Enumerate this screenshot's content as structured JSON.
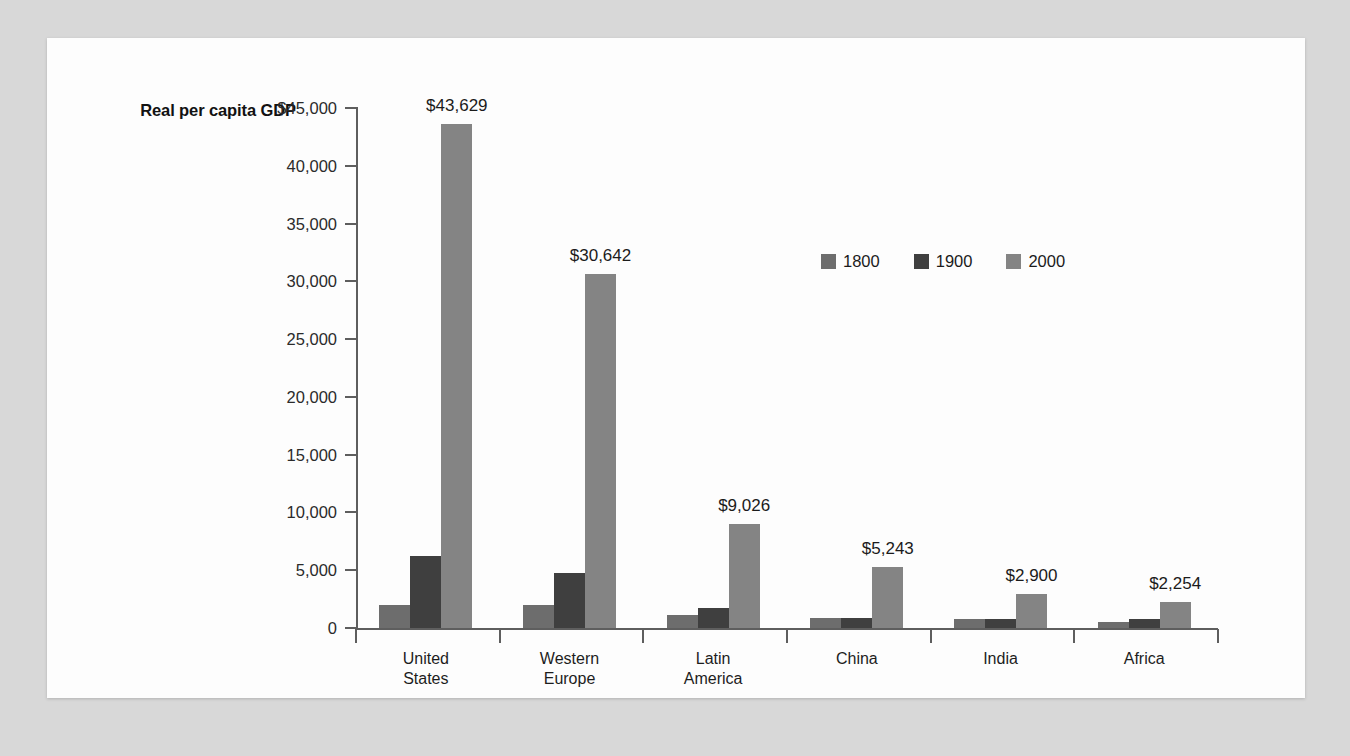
{
  "chart_data": {
    "type": "bar",
    "title": "",
    "subtitle": "",
    "ylabel": "Real per\ncapita GDP",
    "xlabel": "",
    "categories": [
      "United\nStates",
      "Western\nEurope",
      "Latin\nAmerica",
      "China",
      "India",
      "Africa"
    ],
    "series": [
      {
        "name": "1800",
        "color": "#6d6d6d",
        "values": [
          1980,
          1960,
          1150,
          860,
          820,
          560
        ]
      },
      {
        "name": "1900",
        "color": "#3f3f3f",
        "values": [
          6200,
          4750,
          1730,
          860,
          820,
          780
        ]
      },
      {
        "name": "2000",
        "color": "#848484",
        "values": [
          43629,
          30642,
          9026,
          5243,
          2900,
          2254
        ]
      }
    ],
    "value_labels": [
      "$43,629",
      "$30,642",
      "$9,026",
      "$5,243",
      "$2,900",
      "$2,254"
    ],
    "ylim": [
      0,
      45000
    ],
    "yticks": [
      0,
      5000,
      10000,
      15000,
      20000,
      25000,
      30000,
      35000,
      40000,
      45000
    ],
    "ytick_labels": [
      "0",
      "5,000",
      "10,000",
      "15,000",
      "20,000",
      "25,000",
      "30,000",
      "35,000",
      "40,000",
      "$45,000"
    ],
    "grid": false,
    "legend_position": "upper-center-right"
  },
  "legend": {
    "items": [
      {
        "label": "1800",
        "color": "#6d6d6d"
      },
      {
        "label": "1900",
        "color": "#3f3f3f"
      },
      {
        "label": "2000",
        "color": "#848484"
      }
    ]
  },
  "colors": {
    "page_background": "#d8d8d8",
    "panel_background": "#fdfdfd",
    "axis": "#5e5e5e",
    "text": "#1b1b1b"
  }
}
